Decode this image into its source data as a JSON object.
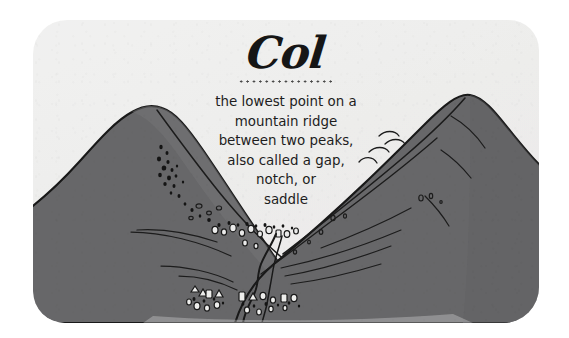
{
  "card": {
    "title": "Col",
    "title_rule": "dotted-rule",
    "definition_lines": [
      "the lowest point on a",
      "mountain ridge",
      "between two peaks,",
      "also called a gap,",
      "notch, or",
      "saddle"
    ],
    "definition_text": "the lowest point on a mountain ridge between two peaks, also called a gap, notch, or saddle"
  },
  "illustration": {
    "subject": "two mountain peaks with a col (saddle) between them",
    "left_peak_label": "left-peak",
    "right_peak_label": "right-peak",
    "col_label": "col-saddle",
    "stream_label": "stream-path"
  },
  "colors": {
    "paper": "#eeecec",
    "mountain_fill": "#666668",
    "mountain_fill_light": "#757577",
    "ink": "#1d1d1d",
    "title_ink": "#161616",
    "page_background": "#ffffff"
  }
}
